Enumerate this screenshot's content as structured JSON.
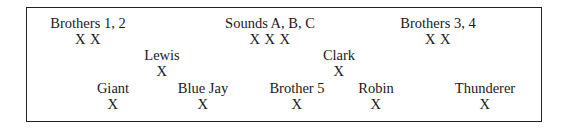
{
  "diagram": {
    "items": [
      {
        "id": "brothers-1-2",
        "label": "Brothers 1, 2",
        "marks": "X X",
        "row": 1
      },
      {
        "id": "sounds-a-b-c",
        "label": "Sounds A, B, C",
        "marks": "X X X",
        "row": 1
      },
      {
        "id": "brothers-3-4",
        "label": "Brothers 3, 4",
        "marks": "X X",
        "row": 1
      },
      {
        "id": "lewis",
        "label": "Lewis",
        "marks": "X",
        "row": 2
      },
      {
        "id": "clark",
        "label": "Clark",
        "marks": "X",
        "row": 2
      },
      {
        "id": "giant",
        "label": "Giant",
        "marks": "X",
        "row": 3
      },
      {
        "id": "blue-jay",
        "label": "Blue Jay",
        "marks": "X",
        "row": 3
      },
      {
        "id": "brother-5",
        "label": "Brother 5",
        "marks": "X",
        "row": 3
      },
      {
        "id": "robin",
        "label": "Robin",
        "marks": "X",
        "row": 3
      },
      {
        "id": "thunderer",
        "label": "Thunderer",
        "marks": "X",
        "row": 3
      }
    ]
  }
}
